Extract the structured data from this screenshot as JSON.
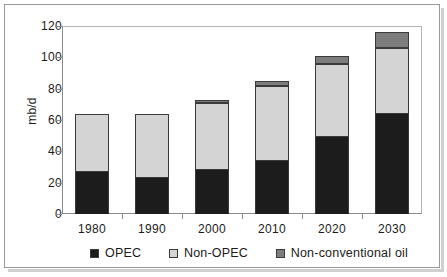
{
  "chart_data": {
    "type": "bar",
    "stacked": true,
    "title": "",
    "xlabel": "",
    "ylabel": "mb/d",
    "ylim": [
      0,
      120
    ],
    "yticks": [
      0,
      20,
      40,
      60,
      80,
      100,
      120
    ],
    "ytick_labels": [
      "0",
      "20",
      "40",
      "60",
      "80",
      "100",
      "120"
    ],
    "grid": false,
    "legend_position": "bottom",
    "categories": [
      "1980",
      "1990",
      "2000",
      "2010",
      "2020",
      "2030"
    ],
    "series": [
      {
        "name": "OPEC",
        "color": "#1c1c1c",
        "values": [
          27,
          23,
          28,
          34,
          49,
          64
        ]
      },
      {
        "name": "Non-OPEC",
        "color": "#d4d4d4",
        "values": [
          37,
          41,
          43,
          48,
          47,
          42
        ]
      },
      {
        "name": "Non-conventional oil",
        "color": "#7d7d7d",
        "values": [
          0,
          0,
          2,
          3,
          5,
          10
        ]
      }
    ],
    "totals": [
      64,
      64,
      73,
      85,
      101,
      116
    ]
  },
  "axis": {
    "y_title": "mb/d"
  },
  "legend": {
    "items": [
      {
        "label": "OPEC",
        "swatch": "legend-swatch-opec"
      },
      {
        "label": "Non-OPEC",
        "swatch": "legend-swatch-non-opec"
      },
      {
        "label": "Non-conventional oil",
        "swatch": "legend-swatch-non-conventional-oil"
      }
    ]
  }
}
